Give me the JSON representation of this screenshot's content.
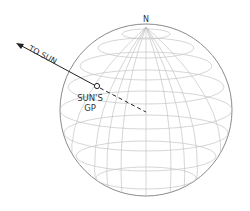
{
  "diagram": {
    "north_label": "N",
    "sun_arrow_label": "TO SUN",
    "gp_label_line1": "SUN'S",
    "gp_label_line2": "GP",
    "colors": {
      "grid": "#bdbdbd",
      "outline": "#8a8a8a",
      "arrow": "#222222",
      "text": "#333333"
    }
  }
}
